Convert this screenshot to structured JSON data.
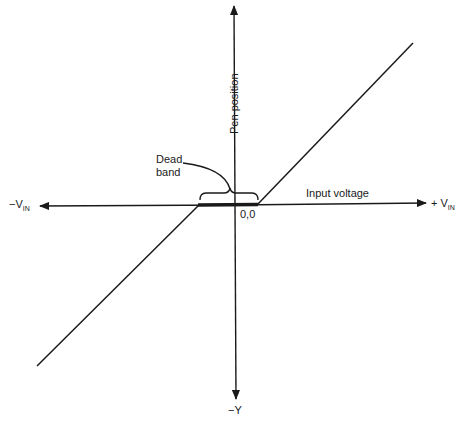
{
  "diagram": {
    "type": "transfer-characteristic",
    "labels": {
      "y_axis": "Pen position",
      "y_negative": "−Y",
      "x_axis": "Input voltage",
      "x_positive_prefix": "+ V",
      "x_positive_sub": "IN",
      "x_negative_prefix": "−V",
      "x_negative_sub": "IN",
      "origin": "0,0",
      "dead_band_line1": "Dead",
      "dead_band_line2": "band"
    },
    "colors": {
      "line": "#1a1a1a",
      "background": "#ffffff"
    }
  }
}
